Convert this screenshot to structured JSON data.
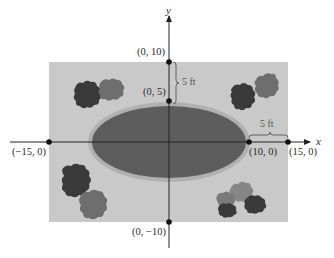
{
  "diagram": {
    "colors": {
      "background": "#ffffff",
      "lot": "#c9c9c9",
      "pool": "#5d5d5d",
      "pool_ring": "#b0b0b0",
      "axis": "#222222",
      "shrub_dark": "#3a3a3a",
      "shrub_mid": "#6a6a6a",
      "shrub_light": "#868686"
    },
    "axes": {
      "x_label": "x",
      "y_label": "y"
    },
    "points": [
      {
        "id": "p_0_10",
        "label": "(0, 10)",
        "x": 0,
        "y": 10
      },
      {
        "id": "p_0_5",
        "label": "(0, 5)",
        "x": 0,
        "y": 5
      },
      {
        "id": "p_0_m10",
        "label": "(0, −10)",
        "x": 0,
        "y": -10
      },
      {
        "id": "p_m15_0",
        "label": "(−15, 0)",
        "x": -15,
        "y": 0
      },
      {
        "id": "p_10_0",
        "label": "(10, 0)",
        "x": 10,
        "y": 0
      },
      {
        "id": "p_15_0",
        "label": "(15, 0)",
        "x": 15,
        "y": 0
      }
    ],
    "dimensions": [
      {
        "id": "vertical_gap",
        "label": "5 ft"
      },
      {
        "id": "horizontal_gap",
        "label": "5 ft"
      }
    ],
    "shapes": {
      "rectangle": {
        "x_min": -15,
        "x_max": 15,
        "y_min": -10,
        "y_max": 10
      },
      "ellipse": {
        "center": [
          0,
          0
        ],
        "semi_major": 10,
        "semi_minor": 5
      }
    }
  }
}
